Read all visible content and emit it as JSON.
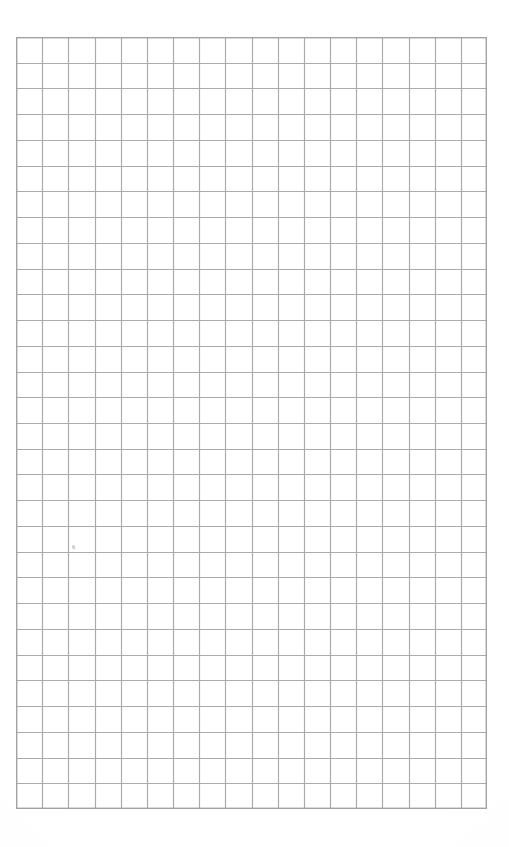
{
  "document": {
    "kind": "graph-paper-sheet",
    "title": "",
    "visible_text": "",
    "page_background_color": "#ffffff",
    "annotation_note": "blank ruled grid sheet, no printed text or labels"
  },
  "grid": {
    "columns": 18,
    "rows": 30,
    "cell_width_px": 26.2,
    "cell_height_px": 25.7,
    "left_px": 16,
    "top_px": 37,
    "width_px": 471,
    "height_px": 772,
    "line_color": "#ababab",
    "border_color": "#a2a2a2",
    "line_width_px": 1.2,
    "border_width_px": 1.4,
    "fill_color": "#ffffff"
  },
  "marks": [
    {
      "name": "faint-speck",
      "x_px": 72,
      "y_px": 545,
      "color": "#c9c9c9",
      "description": "tiny faint smudge inside a cell"
    }
  ],
  "chart_data": {
    "type": "table",
    "title": "",
    "xlabel": "",
    "ylabel": "",
    "columns": 18,
    "rows": 30,
    "values": [],
    "grid": true,
    "legend": "none",
    "note": "Empty graph-paper grid; no plotted data series present."
  }
}
